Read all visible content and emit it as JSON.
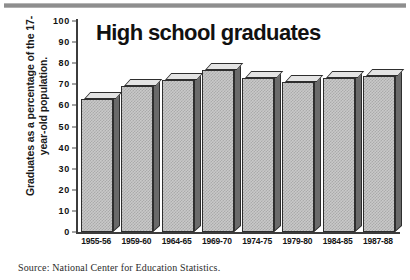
{
  "figure": {
    "title": "High school graduates",
    "y_axis_caption_line1": "Graduates as a percentage of the 17-",
    "y_axis_caption_line2": "year-old population.",
    "source": "Source: National Center for Education Statistics."
  },
  "chart_data": {
    "type": "bar",
    "title": "High school graduates",
    "subtitle": "",
    "xlabel": "",
    "ylabel": "Graduates as a percentage of the 17-year-old population.",
    "categories": [
      "1955-56",
      "1959-60",
      "1964-65",
      "1969-70",
      "1974-75",
      "1979-80",
      "1984-85",
      "1987-88"
    ],
    "values": [
      63,
      69,
      72,
      77,
      73,
      71,
      73,
      74
    ],
    "ylim": [
      0,
      100
    ],
    "ytick_labels": [
      "100",
      "90",
      "80",
      "70",
      "60",
      "50",
      "40",
      "30",
      "20",
      "10",
      "0"
    ],
    "ytick_values": [
      100,
      90,
      80,
      70,
      60,
      50,
      40,
      30,
      20,
      10,
      0
    ],
    "grid": false,
    "legend": null,
    "style": "3d-bar",
    "annotations": [
      "Source: National Center for Education Statistics."
    ]
  },
  "colors": {
    "bar_face": "#c9c9c9",
    "bar_top": "#e4e4e4",
    "bar_side": "#6a6a6a",
    "outline": "#2e2e2e",
    "text": "#111111",
    "background": "#ffffff"
  }
}
